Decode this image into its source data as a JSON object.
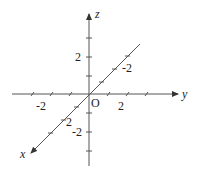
{
  "diagram": {
    "origin_label": "O",
    "axes": {
      "x": {
        "label": "x",
        "tick_labels": [
          "2",
          "-2"
        ]
      },
      "y": {
        "label": "y",
        "tick_labels": [
          "-2",
          "2"
        ]
      },
      "z": {
        "label": "z",
        "tick_labels": [
          "2",
          "-2"
        ]
      }
    }
  }
}
